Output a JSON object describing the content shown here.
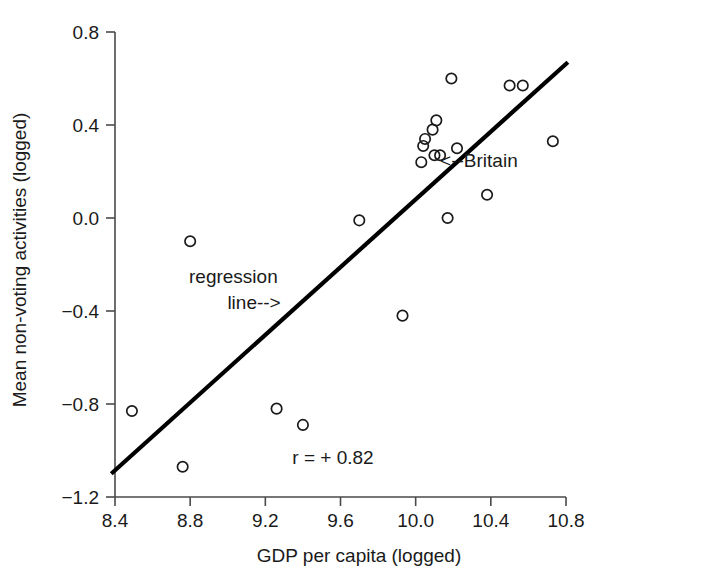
{
  "chart_data": {
    "type": "scatter",
    "title": "",
    "xlabel": "GDP per capita (logged)",
    "ylabel": "Mean non-voting activities (logged)",
    "xlim": [
      8.28,
      10.95
    ],
    "ylim": [
      -1.25,
      0.85
    ],
    "xticks": [
      "8.4",
      "8.8",
      "9.2",
      "9.6",
      "10.0",
      "10.4",
      "10.8"
    ],
    "xtick_values": [
      8.4,
      8.8,
      9.2,
      9.6,
      10.0,
      10.4,
      10.8
    ],
    "yticks": [
      "0.8",
      "0.4",
      "0.0",
      "−0.4",
      "−0.8",
      "−1.2"
    ],
    "ytick_values": [
      0.8,
      0.4,
      0.0,
      -0.4,
      -0.8,
      -1.2
    ],
    "grid": false,
    "legend": "none",
    "points": [
      {
        "x": 8.49,
        "y": -0.83
      },
      {
        "x": 8.76,
        "y": -1.07
      },
      {
        "x": 8.8,
        "y": -0.1
      },
      {
        "x": 9.26,
        "y": -0.82
      },
      {
        "x": 9.4,
        "y": -0.89
      },
      {
        "x": 9.7,
        "y": -0.01
      },
      {
        "x": 9.93,
        "y": -0.42
      },
      {
        "x": 10.05,
        "y": 0.34
      },
      {
        "x": 10.04,
        "y": 0.31
      },
      {
        "x": 10.09,
        "y": 0.38
      },
      {
        "x": 10.1,
        "y": 0.27
      },
      {
        "x": 10.13,
        "y": 0.27
      },
      {
        "x": 10.03,
        "y": 0.24
      },
      {
        "x": 10.11,
        "y": 0.42
      },
      {
        "x": 10.17,
        "y": 0.0
      },
      {
        "x": 10.19,
        "y": 0.6
      },
      {
        "x": 10.22,
        "y": 0.3
      },
      {
        "x": 10.38,
        "y": 0.1
      },
      {
        "x": 10.5,
        "y": 0.57
      },
      {
        "x": 10.57,
        "y": 0.57
      },
      {
        "x": 10.73,
        "y": 0.33
      }
    ],
    "regression_line": {
      "label": "regression line-->",
      "x0": 8.38,
      "y0": -1.1,
      "x1": 10.81,
      "y1": 0.67
    },
    "annotations": [
      {
        "name": "correlation",
        "text": "r = + 0.82",
        "x": 9.56,
        "y": -1.06
      },
      {
        "name": "regression-label-line1",
        "text": "regression",
        "x": 9.03,
        "y": -0.28
      },
      {
        "name": "regression-label-line2",
        "text": "line-->",
        "x": 9.14,
        "y": -0.39
      },
      {
        "name": "britain-label",
        "text": "<--Britain",
        "x": 10.13,
        "y": 0.22
      }
    ],
    "colors": {
      "point_stroke": "#1a1a1a",
      "regression_line": "#000000",
      "axis": "#4a4a4a",
      "text": "#1a1a1a",
      "background": "#ffffff"
    }
  }
}
